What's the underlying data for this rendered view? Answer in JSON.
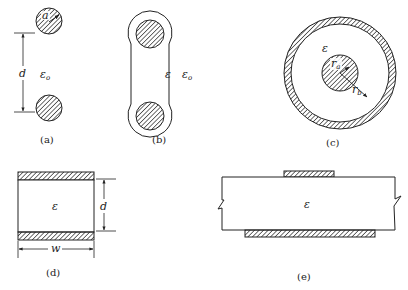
{
  "figure": {
    "panels": [
      {
        "id": "a",
        "caption": "(a)",
        "description": "Two parallel cylindrical wires in free space",
        "labels": {
          "radius": "a",
          "separation": "d",
          "medium": "ε",
          "medium_sub": "o"
        }
      },
      {
        "id": "b",
        "caption": "(b)",
        "description": "Twin-lead line with dielectric jacket",
        "labels": {
          "inner_medium": "ε",
          "outer_medium": "ε",
          "outer_medium_sub": "o"
        }
      },
      {
        "id": "c",
        "caption": "(c)",
        "description": "Coaxial line",
        "labels": {
          "medium": "ε",
          "inner_radius": "r",
          "inner_radius_sub": "a",
          "outer_radius": "r",
          "outer_radius_sub": "b"
        }
      },
      {
        "id": "d",
        "caption": "(d)",
        "description": "Parallel-plate line",
        "labels": {
          "medium": "ε",
          "separation": "d",
          "width": "w"
        }
      },
      {
        "id": "e",
        "caption": "(e)",
        "description": "Microstrip line",
        "labels": {
          "medium": "ε"
        }
      }
    ]
  },
  "colors": {
    "stroke": "#222222",
    "hatch": "#333333",
    "background": "#ffffff"
  }
}
